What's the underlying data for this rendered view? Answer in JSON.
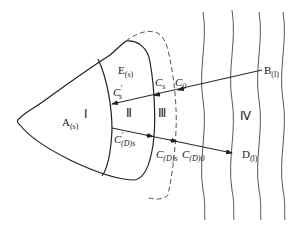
{
  "diagram": {
    "title": "",
    "regions": [
      {
        "id": "I",
        "label": "Ⅰ"
      },
      {
        "id": "II",
        "label": "Ⅱ"
      },
      {
        "id": "III",
        "label": "Ⅲ"
      },
      {
        "id": "IV",
        "label": "Ⅳ"
      }
    ],
    "species": {
      "A": {
        "base": "A",
        "sub": "(s)"
      },
      "E": {
        "base": "E",
        "sub": "(s)"
      },
      "B": {
        "base": "B",
        "sub": "(l)"
      },
      "D": {
        "base": "D",
        "sub": "(l)"
      }
    },
    "concentrations": {
      "C0": {
        "base": "C",
        "sub": "0"
      },
      "Cs": {
        "base": "C",
        "sub": "s",
        "prime": ""
      },
      "Cs_prime": {
        "base": "C",
        "sub": "s",
        "prime": "′"
      },
      "CDs_prime": {
        "base": "C",
        "sub": "(D)s",
        "prime": "′"
      },
      "CDs": {
        "base": "C",
        "sub": "(D)s"
      },
      "CD0": {
        "base": "C",
        "sub": "(D)0"
      }
    },
    "arrows": [
      {
        "from": "B(l)",
        "to": "Cs′",
        "direction": "inward"
      },
      {
        "from": "C′(D)s",
        "to": "D(l)",
        "direction": "outward"
      }
    ],
    "colors": {
      "line": "#222222",
      "dashed": "#555555"
    }
  }
}
